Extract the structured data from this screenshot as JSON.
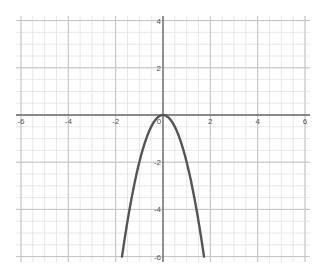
{
  "chart_data": {
    "type": "line",
    "title": "",
    "xlabel": "",
    "ylabel": "",
    "xlim": [
      -6,
      6
    ],
    "ylim": [
      -6,
      4
    ],
    "grid": true,
    "grid_major_step": 2,
    "grid_minor_step": 0.5,
    "x_ticks": [
      -6,
      -4,
      -2,
      0,
      2,
      4,
      6
    ],
    "x_tick_labels": [
      "-6",
      "-4",
      "-2",
      "0",
      "2",
      "4",
      "6"
    ],
    "y_ticks": [
      4,
      2,
      -2,
      -4,
      -6
    ],
    "y_tick_labels": [
      "4",
      "2",
      "-2",
      "-4",
      "-6"
    ],
    "series": [
      {
        "name": "y = -2x^2",
        "expression": "-2*x^2",
        "color": "#555555",
        "x": [
          -1.73,
          -1.5,
          -1.25,
          -1,
          -0.75,
          -0.5,
          -0.25,
          0,
          0.25,
          0.5,
          0.75,
          1,
          1.25,
          1.5,
          1.73
        ],
        "y": [
          -6,
          -4.5,
          -3.125,
          -2,
          -1.125,
          -0.5,
          -0.125,
          0,
          -0.125,
          -0.5,
          -1.125,
          -2,
          -3.125,
          -4.5,
          -6
        ]
      }
    ],
    "legend": null
  },
  "colors": {
    "background": "#ffffff",
    "minor_grid": "#e2e2e2",
    "major_grid": "#c4c4c4",
    "axis": "#666666",
    "curve": "#555555"
  }
}
